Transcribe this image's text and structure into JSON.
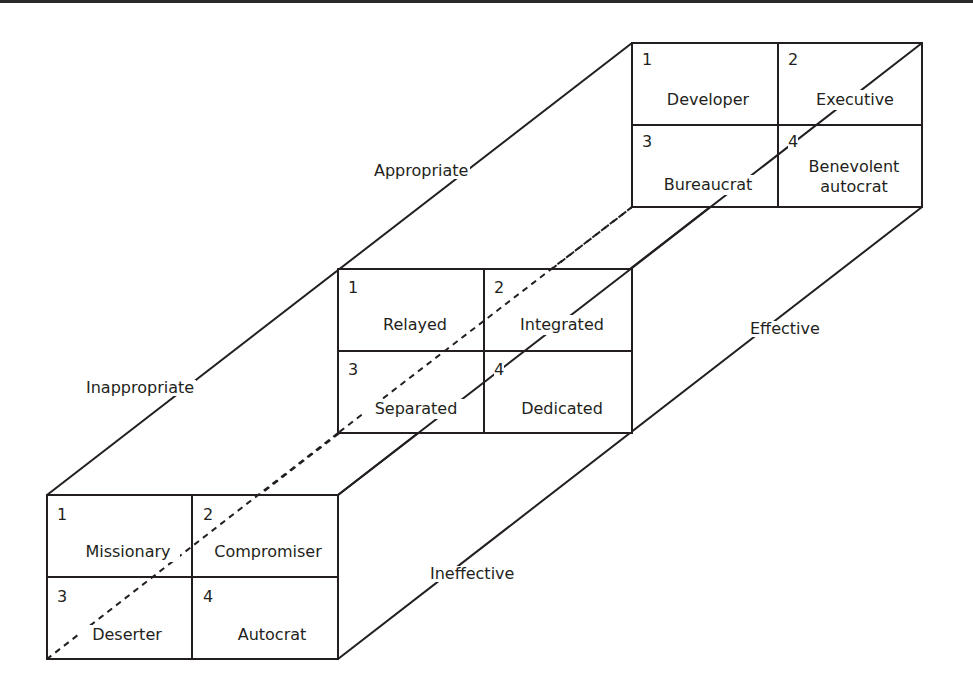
{
  "diagram": {
    "type": "3D grid-cube model",
    "line_color": "#231f20",
    "axis_labels": {
      "appropriate": "Appropriate",
      "inappropriate": "Inappropriate",
      "effective": "Effective",
      "ineffective": "Ineffective"
    },
    "grids": {
      "top": {
        "cells": [
          {
            "number": "1",
            "label": "Developer"
          },
          {
            "number": "2",
            "label": "Executive"
          },
          {
            "number": "3",
            "label": "Bureaucrat"
          },
          {
            "number": "4",
            "label": "Benevolent autocrat",
            "label_line1": "Benevolent",
            "label_line2": "autocrat"
          }
        ]
      },
      "middle": {
        "cells": [
          {
            "number": "1",
            "label": "Relayed"
          },
          {
            "number": "2",
            "label": "Integrated"
          },
          {
            "number": "3",
            "label": "Separated"
          },
          {
            "number": "4",
            "label": "Dedicated"
          }
        ]
      },
      "bottom": {
        "cells": [
          {
            "number": "1",
            "label": "Missionary"
          },
          {
            "number": "2",
            "label": "Compromiser"
          },
          {
            "number": "3",
            "label": "Deserter"
          },
          {
            "number": "4",
            "label": "Autocrat"
          }
        ]
      }
    }
  }
}
